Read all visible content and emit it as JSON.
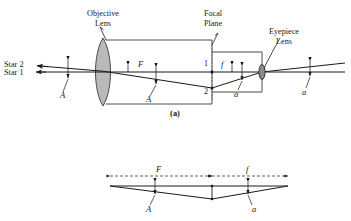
{
  "figure": {
    "caption_a": "(a)",
    "type": "optical-ray-diagram",
    "line_color": "#1a1a1a",
    "lens_fill": "#b9b9b9",
    "eyepiece_fill": "#8a8a8a",
    "tube_color": "#3a3a3a",
    "background": "#ffffff"
  },
  "top_diagram": {
    "labels": {
      "objective_lens_line1": "Objective",
      "objective_lens_line2": "Lens",
      "focal_plane_line1": "Focal",
      "focal_plane_line2": "Plane",
      "eyepiece_lens_line1": "Eyepiece",
      "eyepiece_lens_line2": "Lens",
      "star2": "Star 2",
      "star1": "Star 1"
    },
    "symbols": {
      "angle_A_left": "A",
      "angle_A_mid": "A",
      "focal_length_F": "F",
      "focal_length_f": "f",
      "image_point_1": "1",
      "image_point_2": "2",
      "angle_a_inside": "a",
      "angle_a_outside": "a"
    }
  },
  "bottom_diagram": {
    "symbols": {
      "dimension_F": "F",
      "dimension_f": "f",
      "angle_A": "A",
      "angle_a": "a"
    }
  }
}
